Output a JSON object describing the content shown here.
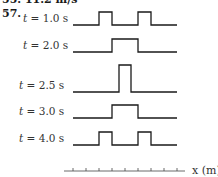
{
  "header": {
    "previous_answer": "55.  11.2 m/s",
    "problem_number": "57."
  },
  "rows": [
    {
      "t_label": "t",
      "eq": " = 1.0 s"
    },
    {
      "t_label": "t",
      "eq": " = 2.0 s"
    },
    {
      "t_label": "t",
      "eq": " = 2.5 s"
    },
    {
      "t_label": "t",
      "eq": " = 3.0 s"
    },
    {
      "t_label": "t",
      "eq": " = 4.0 s"
    }
  ],
  "axis": {
    "label": "x (m)",
    "tick_count": 10
  },
  "colors": {
    "line": "#1a1a1a"
  }
}
